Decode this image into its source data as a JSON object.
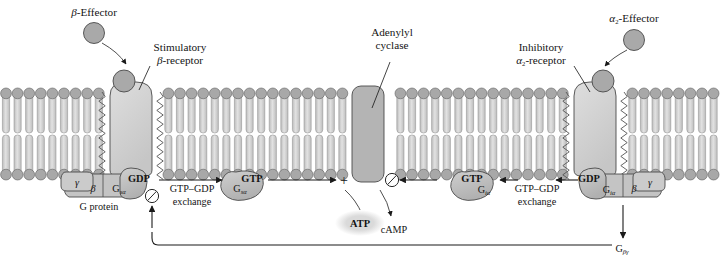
{
  "figure": {
    "kind": "cell-signaling-diagram",
    "background_color": "#ffffff",
    "ink_color": "#141414"
  },
  "palette": {
    "protein_fill": "#b9b9b9",
    "protein_fill_light": "#d8d8d8",
    "receptor_fill": "#d2d2d2",
    "cyclase_fill": "#b4b4b4",
    "effector_fill": "#a9a9a9",
    "lipid_head_fill": "#a8a8a8",
    "lipid_tail_fill": "#c9c9c9",
    "outline": "#4a4a4a",
    "atp_halo": "#dcdcdc"
  },
  "labels": {
    "beta_effector": {
      "symbol": "β",
      "text": "-Effector"
    },
    "stimulatory_receptor": {
      "line1": "Stimulatory",
      "symbol": "β",
      "line2": "-receptor"
    },
    "adenylyl_cyclase": {
      "line1": "Adenylyl",
      "line2": "cyclase"
    },
    "inhibitory_receptor": {
      "line1": "Inhibitory",
      "symbol": "α",
      "sub": "2",
      "line2": "-receptor"
    },
    "alpha2_effector": {
      "symbol": "α",
      "sub": "2",
      "text": "-Effector"
    },
    "g_protein": "G protein",
    "exchange_left": {
      "line1": "GTP–GDP",
      "line2": "exchange"
    },
    "exchange_right": {
      "line1": "GTP–GDP",
      "line2": "exchange"
    },
    "atp": "ATP",
    "camp": "cAMP",
    "g_beta_gamma": {
      "symbol": "G",
      "sub": "βγ"
    },
    "plus_sign": "+"
  },
  "subunits": {
    "left_gamma": "γ",
    "left_beta": "β",
    "left_gs_alpha": {
      "symbol": "G",
      "sub": "sα"
    },
    "left_gdp": "GDP",
    "left_active_gs_alpha": {
      "symbol": "G",
      "sub": "sα"
    },
    "left_gtp": "GTP",
    "right_gtp": "GTP",
    "right_active_gi_alpha": {
      "symbol": "G",
      "sub": "iα"
    },
    "right_gdp": "GDP",
    "right_gi_alpha": {
      "symbol": "G",
      "sub": "iα"
    },
    "right_beta": "β",
    "right_gamma": "γ"
  },
  "symbols": {
    "inhibition_left": "circle-slash",
    "inhibition_right": "circle-slash",
    "activation": "plus"
  }
}
